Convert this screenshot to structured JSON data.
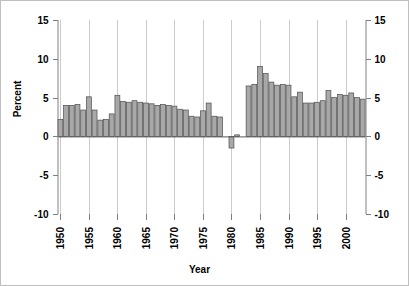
{
  "chart_data": {
    "type": "bar",
    "title": "",
    "xlabel": "Year",
    "ylabel": "Percent",
    "ylim": [
      -10,
      15
    ],
    "xlim": [
      1949.5,
      2003.5
    ],
    "yticks": [
      -10,
      -5,
      0,
      5,
      10,
      15
    ],
    "xticks": [
      1950,
      1955,
      1960,
      1965,
      1970,
      1975,
      1980,
      1985,
      1990,
      1995,
      2000
    ],
    "grid": "vertical-at-xticks",
    "legend": "none",
    "left_axis_labels": [
      "15",
      "10",
      "5",
      "0",
      "-5",
      "-10"
    ],
    "right_axis_labels": [
      "15",
      "10",
      "5",
      "0",
      "-5",
      "-10"
    ],
    "x_tick_labels": [
      "1950",
      "1955",
      "1960",
      "1965",
      "1970",
      "1975",
      "1980",
      "1985",
      "1990",
      "1995",
      "2000"
    ],
    "bar_color": "#a8a8a8",
    "bar_edge_color": "#4d4d4d",
    "axis_color": "#808080",
    "grid_color": "#cccccc",
    "text_color": "#000000",
    "categories": [
      1950,
      1951,
      1952,
      1953,
      1954,
      1955,
      1956,
      1957,
      1958,
      1959,
      1960,
      1961,
      1962,
      1963,
      1964,
      1965,
      1966,
      1967,
      1968,
      1969,
      1970,
      1971,
      1972,
      1973,
      1974,
      1975,
      1976,
      1977,
      1978,
      1979,
      1980,
      1981,
      1982,
      1983,
      1984,
      1985,
      1986,
      1987,
      1988,
      1989,
      1990,
      1991,
      1992,
      1993,
      1994,
      1995,
      1996,
      1997,
      1998,
      1999,
      2000,
      2001,
      2002,
      2003
    ],
    "values": [
      2.2,
      4.0,
      4.0,
      4.1,
      3.4,
      5.1,
      3.4,
      2.1,
      2.2,
      2.9,
      5.3,
      4.5,
      4.4,
      4.6,
      4.4,
      4.3,
      4.2,
      4.0,
      4.1,
      4.0,
      3.9,
      3.5,
      3.4,
      2.6,
      2.5,
      3.3,
      4.3,
      2.6,
      2.5,
      0.0,
      -1.5,
      0.2,
      0.0,
      6.5,
      6.7,
      9.0,
      8.1,
      7.0,
      6.6,
      6.7,
      6.6,
      5.1,
      5.7,
      4.3,
      4.3,
      4.4,
      4.6,
      5.9,
      5.0,
      5.4,
      5.3,
      5.6,
      5.0,
      4.8
    ]
  }
}
